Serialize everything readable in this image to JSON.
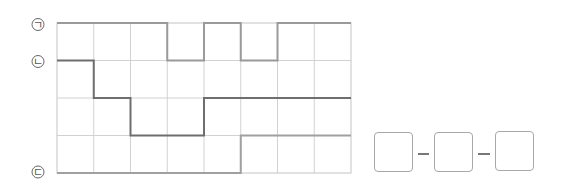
{
  "labels": {
    "line_a": "ㄱ",
    "line_b": "ㄴ",
    "line_c": "ㄷ"
  },
  "grid": {
    "columns": 8,
    "rows": 4,
    "line_color": "#cfcfcf",
    "border_color": "#b8b8b8"
  },
  "paths": {
    "line_a": {
      "color": "#9a9a9a",
      "description": "top path: rows 0-1 stepping"
    },
    "line_b": {
      "color": "#6e6e6e",
      "description": "middle path descending then rising"
    },
    "line_c": {
      "color": "#a0a0a0",
      "description": "bottom path rising at column 5"
    }
  },
  "answer": {
    "boxes": [
      "",
      "",
      ""
    ],
    "separator": "–"
  }
}
